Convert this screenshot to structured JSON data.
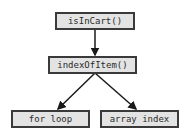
{
  "diagram": {
    "nodes": [
      {
        "id": "isInCart",
        "label": "isInCart()"
      },
      {
        "id": "indexOfItem",
        "label": "indexOfItem()"
      },
      {
        "id": "forLoop",
        "label": "for loop"
      },
      {
        "id": "arrayIndex",
        "label": "array index"
      }
    ],
    "edges": [
      {
        "from": "isInCart",
        "to": "indexOfItem"
      },
      {
        "from": "indexOfItem",
        "to": "forLoop"
      },
      {
        "from": "indexOfItem",
        "to": "arrayIndex"
      }
    ],
    "colors": {
      "node_fill": "#e3e3e3",
      "node_border": "#3a3a3a",
      "edge": "#1a1a1a"
    }
  }
}
